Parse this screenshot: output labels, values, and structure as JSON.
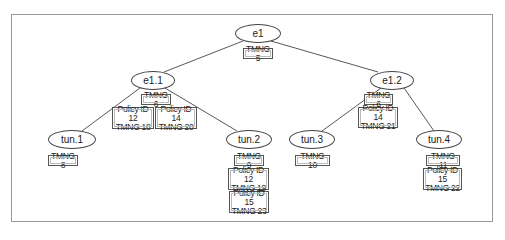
{
  "diagram": {
    "nodes": [
      {
        "id": "e1",
        "label": "e1",
        "tags": [
          [
            "TMNG 5"
          ]
        ]
      },
      {
        "id": "e1.1",
        "label": "e1.1",
        "tags": [
          [
            "TMNG 6"
          ],
          [
            "Policy ID 12",
            "TMNG 18"
          ],
          [
            "Policy ID 14",
            "TMNG 20"
          ]
        ]
      },
      {
        "id": "e1.2",
        "label": "e1.2",
        "tags": [
          [
            "TMNG 6"
          ],
          [
            "Policy ID 14",
            "TMNG 21"
          ]
        ]
      },
      {
        "id": "tun.1",
        "label": "tun.1",
        "tags": [
          [
            "TMNG 8"
          ]
        ]
      },
      {
        "id": "tun.2",
        "label": "tun.2",
        "tags": [
          [
            "TMNG 9"
          ],
          [
            "Policy ID 12",
            "TMNG 19"
          ],
          [
            "Policy ID 15",
            "TMNG 23"
          ]
        ]
      },
      {
        "id": "tun.3",
        "label": "tun.3",
        "tags": [
          [
            "TMNG 10"
          ]
        ]
      },
      {
        "id": "tun.4",
        "label": "tun.4",
        "tags": [
          [
            "TMNG 11"
          ],
          [
            "Policy ID 15",
            "TMNG 22"
          ]
        ]
      }
    ],
    "edges": [
      [
        "e1",
        "e1.1"
      ],
      [
        "e1",
        "e1.2"
      ],
      [
        "e1.1",
        "tun.1"
      ],
      [
        "e1.1",
        "tun.2"
      ],
      [
        "e1.2",
        "tun.3"
      ],
      [
        "e1.2",
        "tun.4"
      ]
    ]
  },
  "labels": {
    "e1": "e1",
    "e1_1": "e1.1",
    "e1_2": "e1.2",
    "tun1": "tun.1",
    "tun2": "tun.2",
    "tun3": "tun.3",
    "tun4": "tun.4"
  },
  "tags": {
    "e1_tmng": "TMNG 5",
    "e1_1_tmng": "TMNG 6",
    "e1_1_p12_policy": "Policy ID 12",
    "e1_1_p12_tmng": "TMNG 18",
    "e1_1_p14_policy": "Policy ID 14",
    "e1_1_p14_tmng": "TMNG 20",
    "e1_2_tmng": "TMNG 6",
    "e1_2_p14_policy": "Policy ID 14",
    "e1_2_p14_tmng": "TMNG 21",
    "tun1_tmng": "TMNG 8",
    "tun2_tmng": "TMNG 9",
    "tun2_p12_policy": "Policy ID 12",
    "tun2_p12_tmng": "TMNG 19",
    "tun2_p15_policy": "Policy ID 15",
    "tun2_p15_tmng": "TMNG 23",
    "tun3_tmng": "TMNG 10",
    "tun4_tmng": "TMNG 11",
    "tun4_p15_policy": "Policy ID 15",
    "tun4_p15_tmng": "TMNG 22"
  },
  "colors": {
    "frame": "#9a9a9a",
    "edge": "#444444",
    "text": "#222222"
  }
}
